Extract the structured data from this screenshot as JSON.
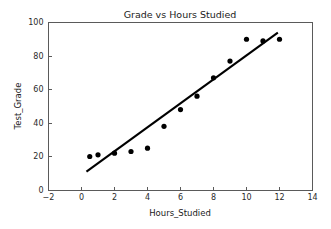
{
  "chart_data": {
    "type": "scatter",
    "title": "Grade vs Hours Studied",
    "xlabel": "Hours_Studied",
    "ylabel": "Test_Grade",
    "xlim": [
      -2,
      14
    ],
    "ylim": [
      0,
      100
    ],
    "xticks": [
      -2,
      0,
      2,
      4,
      6,
      8,
      10,
      12,
      14
    ],
    "yticks": [
      0,
      20,
      40,
      60,
      80,
      100
    ],
    "xtick_labels": [
      "−2",
      "0",
      "2",
      "4",
      "6",
      "8",
      "10",
      "12",
      "14"
    ],
    "ytick_labels": [
      "0",
      "20",
      "40",
      "60",
      "80",
      "100"
    ],
    "grid": false,
    "legend": null,
    "series": [
      {
        "name": "Test_Grade",
        "type": "scatter",
        "marker": "circle",
        "color": "#000000",
        "x": [
          0.5,
          1.0,
          2.0,
          3.0,
          4.0,
          5.0,
          6.0,
          7.0,
          8.0,
          9.0,
          10.0,
          11.0,
          12.0
        ],
        "y": [
          20,
          21,
          22,
          23,
          25,
          38,
          48,
          56,
          67,
          77,
          90,
          89,
          90
        ]
      },
      {
        "name": "Linear fit",
        "type": "line",
        "color": "#000000",
        "x": [
          0.3,
          11.9
        ],
        "y": [
          11,
          94
        ]
      }
    ],
    "points": [
      {
        "x": 0.5,
        "y": 20
      },
      {
        "x": 1.0,
        "y": 21
      },
      {
        "x": 2.0,
        "y": 22
      },
      {
        "x": 3.0,
        "y": 23
      },
      {
        "x": 4.0,
        "y": 25
      },
      {
        "x": 5.0,
        "y": 38
      },
      {
        "x": 6.0,
        "y": 48
      },
      {
        "x": 7.0,
        "y": 56
      },
      {
        "x": 8.0,
        "y": 67
      },
      {
        "x": 9.0,
        "y": 77
      },
      {
        "x": 10.0,
        "y": 90
      },
      {
        "x": 11.0,
        "y": 89
      },
      {
        "x": 12.0,
        "y": 90
      }
    ],
    "colors": {
      "background": "#ffffff",
      "marker": "#000000",
      "line": "#000000",
      "axis": "#5a5a5a",
      "text": "#1a1a1a"
    }
  }
}
